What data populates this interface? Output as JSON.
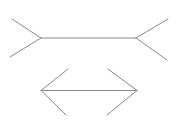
{
  "canvas": {
    "width": 176,
    "height": 130,
    "background_color": "#ffffff"
  },
  "illusion": {
    "name": "muller-lyer-illusion",
    "stroke_color": "#8a8a8a",
    "stroke_width": 1,
    "figures": [
      {
        "id": "top-line-fins-outward",
        "description": "horizontal line with outward-spreading fins at both ends",
        "shaft": [
          41,
          38,
          136,
          38
        ],
        "fins": [
          [
            41,
            38,
            12,
            19
          ],
          [
            41,
            38,
            10,
            57
          ],
          [
            136,
            38,
            168,
            19
          ],
          [
            136,
            38,
            167,
            60
          ]
        ]
      },
      {
        "id": "bottom-line-arrowheads-inward",
        "description": "horizontal line with inward-folding arrowhead fins (double-headed arrow)",
        "shaft": [
          41,
          90.5,
          137,
          90.5
        ],
        "fins": [
          [
            41,
            90.5,
            68,
            69
          ],
          [
            41,
            90.5,
            66,
            115
          ],
          [
            137,
            90.5,
            108,
            69
          ],
          [
            137,
            90.5,
            107,
            115
          ]
        ]
      }
    ]
  }
}
